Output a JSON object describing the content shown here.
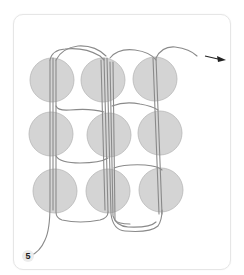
{
  "diagram": {
    "type": "weaving-pattern",
    "step_label": "5",
    "colors": {
      "bead_fill": "#d4d4d4",
      "bead_stroke": "#b8b8b8",
      "thread": "#8a8a8a",
      "arrow": "#222222",
      "frame_border": "#e6e6e6"
    },
    "grid": {
      "rows": 3,
      "cols": 3,
      "beads": [
        {
          "row": 1,
          "col": 1,
          "cx": 52,
          "cy": 80,
          "r": 22
        },
        {
          "row": 1,
          "col": 2,
          "cx": 103,
          "cy": 80,
          "r": 22
        },
        {
          "row": 1,
          "col": 3,
          "cx": 155,
          "cy": 79,
          "r": 22
        },
        {
          "row": 2,
          "col": 1,
          "cx": 51,
          "cy": 134,
          "r": 22
        },
        {
          "row": 2,
          "col": 2,
          "cx": 109,
          "cy": 135,
          "r": 22
        },
        {
          "row": 2,
          "col": 3,
          "cx": 160,
          "cy": 133,
          "r": 22
        },
        {
          "row": 3,
          "col": 1,
          "cx": 55,
          "cy": 191,
          "r": 22
        },
        {
          "row": 3,
          "col": 2,
          "cx": 108,
          "cy": 191,
          "r": 22
        },
        {
          "row": 3,
          "col": 3,
          "cx": 161,
          "cy": 190,
          "r": 22
        }
      ]
    },
    "arrow": {
      "direction": "right",
      "meaning": "thread exit"
    }
  }
}
